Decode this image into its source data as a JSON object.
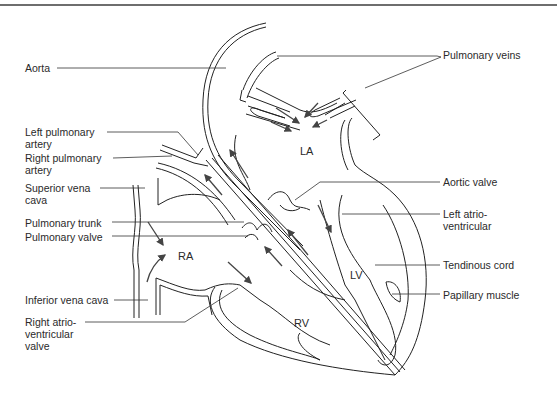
{
  "diagram": {
    "title": "",
    "chambers": {
      "la": "LA",
      "ra": "RA",
      "lv": "LV",
      "rv": "RV"
    },
    "labels_left": [
      {
        "id": "aorta",
        "lines": [
          "Aorta"
        ]
      },
      {
        "id": "left-pulmonary-artery",
        "lines": [
          "Left pulmonary",
          "artery"
        ]
      },
      {
        "id": "right-pulmonary-artery",
        "lines": [
          "Right pulmonary",
          "artery"
        ]
      },
      {
        "id": "superior-vena-cava",
        "lines": [
          "Superior vena",
          "cava"
        ]
      },
      {
        "id": "pulmonary-trunk",
        "lines": [
          "Pulmonary trunk"
        ]
      },
      {
        "id": "pulmonary-valve",
        "lines": [
          "Pulmonary valve"
        ]
      },
      {
        "id": "inferior-vena-cava",
        "lines": [
          "Inferior vena cava"
        ]
      },
      {
        "id": "right-atrioventricular-valve",
        "lines": [
          "Right atrio-",
          "ventricular",
          "valve"
        ]
      }
    ],
    "labels_right": [
      {
        "id": "pulmonary-veins",
        "lines": [
          "Pulmonary veins"
        ]
      },
      {
        "id": "aortic-valve",
        "lines": [
          "Aortic valve"
        ]
      },
      {
        "id": "left-atrioventricular",
        "lines": [
          "Left atrio-",
          "ventricular"
        ]
      },
      {
        "id": "tendinous-cord",
        "lines": [
          "Tendinous cord"
        ]
      },
      {
        "id": "papillary-muscle",
        "lines": [
          "Papillary muscle"
        ]
      }
    ]
  }
}
